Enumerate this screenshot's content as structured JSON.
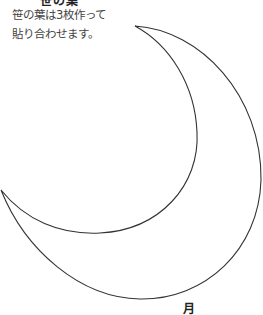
{
  "heading": {
    "text": "笹の葉"
  },
  "note": {
    "lines": [
      "笹の葉は3枚作って",
      "貼り合わせます。"
    ]
  },
  "shape": {
    "name": "crescent-moon",
    "stroke_color": "#333333",
    "fill_color": "#ffffff"
  },
  "label": {
    "text": "月"
  }
}
